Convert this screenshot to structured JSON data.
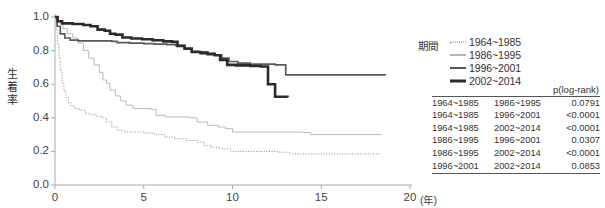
{
  "chart_data": {
    "type": "line",
    "title": "",
    "xlabel": "(年)",
    "ylabel": "生着率",
    "xlim": [
      0,
      20
    ],
    "ylim": [
      0,
      1.0
    ],
    "xticks": [
      "0",
      "5",
      "10",
      "15",
      "20"
    ],
    "yticks": [
      "0.0",
      "0.2",
      "0.4",
      "0.6",
      "0.8",
      "1.0"
    ],
    "grid": false,
    "legend_position": "right",
    "series": [
      {
        "name": "1964~1985",
        "style": "dotted",
        "color": "#8a8a8a",
        "points": [
          [
            0,
            1.0
          ],
          [
            0.08,
            0.92
          ],
          [
            0.15,
            0.84
          ],
          [
            0.22,
            0.76
          ],
          [
            0.3,
            0.68
          ],
          [
            0.4,
            0.61
          ],
          [
            0.5,
            0.56
          ],
          [
            0.62,
            0.52
          ],
          [
            0.75,
            0.49
          ],
          [
            0.9,
            0.47
          ],
          [
            1.1,
            0.455
          ],
          [
            1.4,
            0.445
          ],
          [
            1.7,
            0.425
          ],
          [
            2.0,
            0.42
          ],
          [
            2.3,
            0.41
          ],
          [
            2.6,
            0.4
          ],
          [
            2.9,
            0.375
          ],
          [
            3.2,
            0.345
          ],
          [
            3.5,
            0.325
          ],
          [
            3.9,
            0.315
          ],
          [
            5.0,
            0.31
          ],
          [
            5.6,
            0.3
          ],
          [
            6.2,
            0.285
          ],
          [
            6.8,
            0.275
          ],
          [
            7.4,
            0.265
          ],
          [
            8.0,
            0.255
          ],
          [
            8.4,
            0.235
          ],
          [
            8.8,
            0.225
          ],
          [
            9.3,
            0.215
          ],
          [
            9.9,
            0.2
          ],
          [
            12.6,
            0.195
          ],
          [
            13.2,
            0.185
          ],
          [
            18.3,
            0.185
          ]
        ]
      },
      {
        "name": "1986~1995",
        "style": "solid-thin",
        "color": "#b9b9b9",
        "points": [
          [
            0,
            1.0
          ],
          [
            0.2,
            0.965
          ],
          [
            0.45,
            0.93
          ],
          [
            0.7,
            0.9
          ],
          [
            1.0,
            0.875
          ],
          [
            1.3,
            0.845
          ],
          [
            1.6,
            0.8
          ],
          [
            1.9,
            0.755
          ],
          [
            2.2,
            0.715
          ],
          [
            2.5,
            0.67
          ],
          [
            2.7,
            0.625
          ],
          [
            2.9,
            0.605
          ],
          [
            3.1,
            0.565
          ],
          [
            3.4,
            0.53
          ],
          [
            3.7,
            0.5
          ],
          [
            4.0,
            0.475
          ],
          [
            4.4,
            0.455
          ],
          [
            5.4,
            0.45
          ],
          [
            5.7,
            0.415
          ],
          [
            6.2,
            0.405
          ],
          [
            7.6,
            0.4
          ],
          [
            8.0,
            0.375
          ],
          [
            8.6,
            0.355
          ],
          [
            9.2,
            0.345
          ],
          [
            9.6,
            0.335
          ],
          [
            10.0,
            0.315
          ],
          [
            14.0,
            0.312
          ],
          [
            14.4,
            0.3
          ],
          [
            18.4,
            0.3
          ]
        ]
      },
      {
        "name": "1996~2001",
        "style": "solid-medium",
        "color": "#5a5a5a",
        "points": [
          [
            0,
            1.0
          ],
          [
            0.12,
            0.945
          ],
          [
            0.3,
            0.9
          ],
          [
            0.55,
            0.875
          ],
          [
            0.85,
            0.862
          ],
          [
            1.3,
            0.858
          ],
          [
            3.2,
            0.855
          ],
          [
            3.5,
            0.848
          ],
          [
            4.2,
            0.845
          ],
          [
            5.0,
            0.842
          ],
          [
            5.6,
            0.838
          ],
          [
            6.3,
            0.835
          ],
          [
            6.8,
            0.83
          ],
          [
            7.3,
            0.81
          ],
          [
            7.7,
            0.795
          ],
          [
            8.1,
            0.792
          ],
          [
            8.6,
            0.785
          ],
          [
            9.0,
            0.775
          ],
          [
            9.4,
            0.755
          ],
          [
            9.8,
            0.735
          ],
          [
            10.3,
            0.725
          ],
          [
            11.0,
            0.72
          ],
          [
            12.4,
            0.715
          ],
          [
            13.0,
            0.655
          ],
          [
            18.6,
            0.652
          ]
        ]
      },
      {
        "name": "2002~2014",
        "style": "solid-thick",
        "color": "#2b2b2b",
        "points": [
          [
            0,
            1.0
          ],
          [
            0.15,
            0.975
          ],
          [
            0.4,
            0.962
          ],
          [
            1.0,
            0.958
          ],
          [
            1.6,
            0.952
          ],
          [
            2.0,
            0.945
          ],
          [
            2.4,
            0.925
          ],
          [
            2.8,
            0.918
          ],
          [
            3.1,
            0.9
          ],
          [
            3.4,
            0.895
          ],
          [
            3.8,
            0.878
          ],
          [
            4.3,
            0.872
          ],
          [
            4.9,
            0.868
          ],
          [
            5.5,
            0.862
          ],
          [
            6.1,
            0.855
          ],
          [
            6.6,
            0.852
          ],
          [
            6.9,
            0.828
          ],
          [
            7.3,
            0.812
          ],
          [
            7.7,
            0.792
          ],
          [
            8.2,
            0.785
          ],
          [
            8.6,
            0.778
          ],
          [
            9.0,
            0.772
          ],
          [
            9.3,
            0.745
          ],
          [
            9.7,
            0.715
          ],
          [
            10.2,
            0.712
          ],
          [
            11.0,
            0.708
          ],
          [
            11.6,
            0.705
          ],
          [
            12.0,
            0.6
          ],
          [
            12.4,
            0.525
          ],
          [
            13.1,
            0.522
          ]
        ]
      }
    ]
  },
  "legend": {
    "title": "期間",
    "items": [
      {
        "label": "1964~1985"
      },
      {
        "label": "1986~1995"
      },
      {
        "label": "1996~2001"
      },
      {
        "label": "2002~2014"
      }
    ]
  },
  "pvalue_table": {
    "header": "p(log-rank)",
    "rows": [
      {
        "group_a": "1964~1985",
        "group_b": "1986~1995",
        "p": "0.0791"
      },
      {
        "group_a": "1964~1985",
        "group_b": "1996~2001",
        "p": "<0.0001"
      },
      {
        "group_a": "1964~1985",
        "group_b": "2002~2014",
        "p": "<0.0001"
      },
      {
        "group_a": "1986~1995",
        "group_b": "1996~2001",
        "p": "0.0307"
      },
      {
        "group_a": "1986~1995",
        "group_b": "2002~2014",
        "p": "<0.0001"
      },
      {
        "group_a": "1996~2001",
        "group_b": "2002~2014",
        "p": "0.0853"
      }
    ]
  },
  "axes": {
    "y_label_chars": [
      "生",
      "着",
      "率"
    ],
    "x_unit": "(年)"
  }
}
